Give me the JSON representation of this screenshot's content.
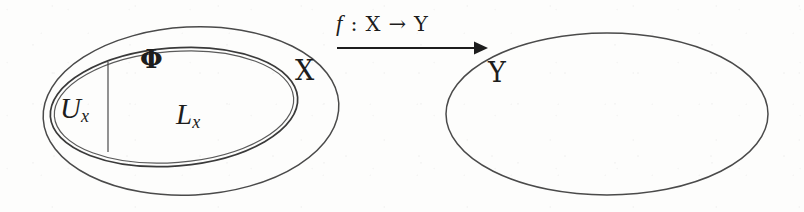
{
  "figure": {
    "domain_set": {
      "outer_label": "×",
      "outer_label_text": "X",
      "inner_region_left_label": "U",
      "inner_region_left_sub": "x",
      "inner_region_right_label": "L",
      "inner_region_right_sub": "x",
      "boundary_point_label": "Φ"
    },
    "codomain_set": {
      "label_text": "Y"
    },
    "map": {
      "function_name": "f",
      "colon": ":",
      "source": "X",
      "arrow": "→",
      "target": "Y",
      "full_label": "f : X → Y"
    },
    "labels": {
      "Ux": "U",
      "Ux_sub": "x",
      "Lx": "L",
      "Lx_sub": "x",
      "X": "X",
      "Y": "Y",
      "phi": "Φ"
    },
    "colors": {
      "ink": "#1d1d1d",
      "stroke": "#3a3a3a",
      "stroke_light": "#6b6b6b",
      "paper": "#fdfdfc"
    }
  }
}
